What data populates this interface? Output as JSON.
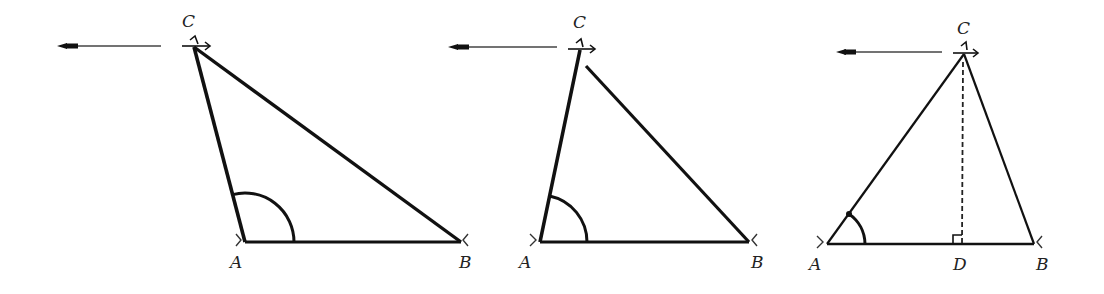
{
  "figure": {
    "stroke_color": "#111111",
    "panels": [
      {
        "id": "panel-1",
        "vertices": {
          "A": {
            "label": "A",
            "x": 245,
            "y": 242,
            "lx": 230,
            "ly": 268
          },
          "B": {
            "label": "B",
            "x": 461,
            "y": 242,
            "lx": 459,
            "ly": 268
          },
          "C": {
            "label": "C",
            "x": 194,
            "y": 47,
            "lx": 182,
            "ly": 27
          }
        },
        "arrow": {
          "x1": 161,
          "y1": 46,
          "x2": 62,
          "y2": 46,
          "direction": "left"
        },
        "angle_arc": {
          "vertex": "A",
          "radius": 49,
          "marked": true
        },
        "thick_lines": true
      },
      {
        "id": "panel-2",
        "vertices": {
          "A": {
            "label": "A",
            "x": 540,
            "y": 242,
            "lx": 519,
            "ly": 268
          },
          "B": {
            "label": "B",
            "x": 749,
            "y": 242,
            "lx": 751,
            "ly": 268
          },
          "C": {
            "label": "C",
            "x": 580,
            "y": 50,
            "lx": 573,
            "ly": 28
          }
        },
        "arrow": {
          "x1": 557,
          "y1": 47,
          "x2": 453,
          "y2": 47,
          "direction": "left"
        },
        "angle_arc": {
          "vertex": "A",
          "radius": 47,
          "marked": true
        },
        "thick_lines": true
      },
      {
        "id": "panel-3",
        "vertices": {
          "A": {
            "label": "A",
            "x": 827,
            "y": 244,
            "lx": 809,
            "ly": 270
          },
          "B": {
            "label": "B",
            "x": 1034,
            "y": 244,
            "lx": 1036,
            "ly": 270
          },
          "C": {
            "label": "C",
            "x": 964,
            "y": 54,
            "lx": 957,
            "ly": 34
          },
          "D": {
            "label": "D",
            "x": 962,
            "y": 244,
            "lx": 953,
            "ly": 270
          }
        },
        "arrow": {
          "x1": 942,
          "y1": 52,
          "x2": 838,
          "y2": 52,
          "direction": "left"
        },
        "angle_arc": {
          "vertex": "A",
          "radius": 37,
          "marked": true
        },
        "altitude": {
          "from": "C",
          "to": "D",
          "style": "dashed",
          "right_angle_marker": true
        },
        "thick_lines": false
      }
    ]
  }
}
